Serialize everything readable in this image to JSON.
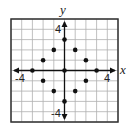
{
  "chart_data": {
    "type": "scatter",
    "title": "",
    "xlabel": "x",
    "ylabel": "y",
    "xlim": [
      -5,
      5
    ],
    "ylim": [
      -5,
      5
    ],
    "grid": true,
    "tick_labels": {
      "x": [
        "-4",
        "4"
      ],
      "y": [
        "4",
        "-4"
      ]
    },
    "points": [
      {
        "x": 0,
        "y": 3
      },
      {
        "x": -1,
        "y": 2
      },
      {
        "x": 1,
        "y": 2
      },
      {
        "x": -2,
        "y": 1
      },
      {
        "x": 2,
        "y": 1
      },
      {
        "x": -3,
        "y": 0
      },
      {
        "x": 0,
        "y": 0
      },
      {
        "x": 3,
        "y": 0
      },
      {
        "x": -2,
        "y": -1
      },
      {
        "x": 2,
        "y": -1
      },
      {
        "x": -1,
        "y": -2
      },
      {
        "x": 1,
        "y": -2
      },
      {
        "x": 0,
        "y": -3
      }
    ]
  },
  "labels": {
    "x_axis": "x",
    "y_axis": "y",
    "x_neg": "-4",
    "x_pos": "4",
    "y_pos": "4",
    "y_neg": "-4"
  },
  "colors": {
    "grid": "#b0b0b0",
    "frame": "#333333",
    "axis": "#111111",
    "point": "#111111"
  }
}
